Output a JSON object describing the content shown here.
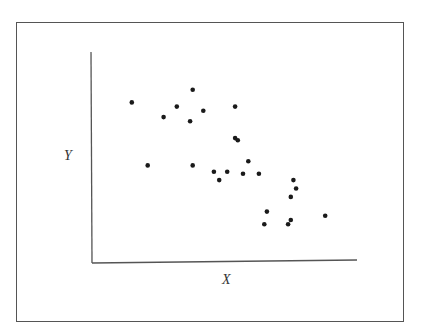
{
  "chart_data": {
    "type": "scatter",
    "title": "",
    "xlabel": "X",
    "ylabel": "Y",
    "xlim": [
      0,
      100
    ],
    "ylim": [
      0,
      100
    ],
    "grid": false,
    "legend": null,
    "ticks": "none",
    "note": "Axes have no tick marks or numeric labels; values are normalized 0-100 positions along each axis. Shows a negative correlation.",
    "series": [
      {
        "name": "points",
        "color": "#1a1a1a",
        "points": [
          {
            "x": 15,
            "y": 76
          },
          {
            "x": 38,
            "y": 82
          },
          {
            "x": 32,
            "y": 74
          },
          {
            "x": 42,
            "y": 72
          },
          {
            "x": 54,
            "y": 74
          },
          {
            "x": 27,
            "y": 69
          },
          {
            "x": 37,
            "y": 67
          },
          {
            "x": 54,
            "y": 59
          },
          {
            "x": 55,
            "y": 58
          },
          {
            "x": 21,
            "y": 46
          },
          {
            "x": 38,
            "y": 46
          },
          {
            "x": 59,
            "y": 48
          },
          {
            "x": 46,
            "y": 43
          },
          {
            "x": 51,
            "y": 43
          },
          {
            "x": 57,
            "y": 42
          },
          {
            "x": 63,
            "y": 42
          },
          {
            "x": 48,
            "y": 39
          },
          {
            "x": 76,
            "y": 39
          },
          {
            "x": 77,
            "y": 35
          },
          {
            "x": 75,
            "y": 31
          },
          {
            "x": 66,
            "y": 24
          },
          {
            "x": 88,
            "y": 22
          },
          {
            "x": 75,
            "y": 20
          },
          {
            "x": 65,
            "y": 18
          },
          {
            "x": 74,
            "y": 18
          }
        ]
      }
    ]
  },
  "axes": {
    "x_label": "X",
    "y_label": "Y"
  }
}
